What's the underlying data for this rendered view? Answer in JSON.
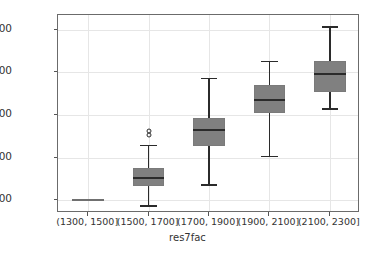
{
  "chart_data": {
    "type": "box",
    "title": "",
    "xlabel": "res7fac",
    "ylabel": "",
    "grid": true,
    "legend": "none",
    "ylim": [
      1540,
      2470
    ],
    "yticks": [
      1600,
      1800,
      2000,
      2200,
      2400
    ],
    "ytick_labels": [
      "1600",
      "1800",
      "2000",
      "2200",
      "2400"
    ],
    "categories": [
      "(1300, 1500]",
      "(1500, 1700]",
      "(1700, 1900]",
      "(1900, 2100]",
      "(2100, 2300]"
    ],
    "boxes": [
      {
        "category": "(1300, 1500]",
        "whisker_low": 1600,
        "q1": 1600,
        "median": 1600,
        "q3": 1600,
        "whisker_high": 1600,
        "fliers": [],
        "degenerate": true
      },
      {
        "category": "(1500, 1700]",
        "whisker_low": 1577,
        "q1": 1668,
        "median": 1705,
        "q3": 1753,
        "whisker_high": 1861,
        "fliers": [
          1925,
          1905
        ],
        "degenerate": false
      },
      {
        "category": "(1700, 1900]",
        "whisker_low": 1675,
        "q1": 1856,
        "median": 1930,
        "q3": 1986,
        "whisker_high": 2175,
        "fliers": [],
        "degenerate": false
      },
      {
        "category": "(1900, 2100]",
        "whisker_low": 1809,
        "q1": 2009,
        "median": 2070,
        "q3": 2140,
        "whisker_high": 2256,
        "fliers": [],
        "degenerate": false
      },
      {
        "category": "(2100, 2300]",
        "whisker_low": 2033,
        "q1": 2107,
        "median": 2191,
        "q3": 2256,
        "whisker_high": 2418,
        "fliers": [],
        "degenerate": false
      }
    ],
    "colors": {
      "box_fill": "#808080",
      "box_edge": "#7a7a7a",
      "median": "#2b2b2b",
      "whisker": "#2b2b2b",
      "grid": "#e6e6e6",
      "frame": "#6b6b6b",
      "background": "#ffffff",
      "text": "#333333"
    }
  }
}
